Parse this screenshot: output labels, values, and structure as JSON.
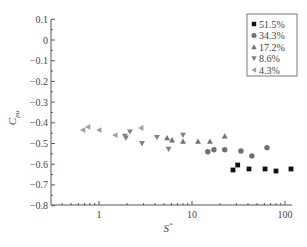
{
  "chart_data": {
    "type": "scatter",
    "title": "",
    "xlabel": "S*",
    "ylabel": "C_pu",
    "xscale": "log",
    "xlim": [
      0.3,
      130
    ],
    "ylim": [
      -0.8,
      0.1
    ],
    "xticks": [
      1,
      10,
      100
    ],
    "xtick_labels": [
      "1",
      "10",
      "100"
    ],
    "yticks": [
      0.1,
      0,
      -0.1,
      -0.2,
      -0.3,
      -0.4,
      -0.5,
      -0.6,
      -0.7,
      -0.8
    ],
    "ytick_labels": [
      "0.1",
      "0",
      "−0.1",
      "−0.2",
      "−0.3",
      "−0.4",
      "−0.5",
      "−0.6",
      "−0.7",
      "−0.8"
    ],
    "grid": false,
    "legend_position": "upper right",
    "series": [
      {
        "name": "51.5%",
        "marker": "square",
        "x": [
          27.6,
          31,
          41,
          61,
          80,
          116
        ],
        "y": [
          -0.628,
          -0.604,
          -0.623,
          -0.623,
          -0.633,
          -0.623
        ]
      },
      {
        "name": "34.3%",
        "marker": "circle",
        "x": [
          14.8,
          17.2,
          22.5,
          33.6,
          44,
          64
        ],
        "y": [
          -0.54,
          -0.53,
          -0.53,
          -0.536,
          -0.56,
          -0.52
        ]
      },
      {
        "name": "17.2%",
        "marker": "triangle-up",
        "x": [
          5.4,
          6.1,
          8.0,
          11.6,
          15.6,
          22.5
        ],
        "y": [
          -0.473,
          -0.483,
          -0.49,
          -0.49,
          -0.49,
          -0.464
        ]
      },
      {
        "name": "8.6%",
        "marker": "triangle-down",
        "x": [
          1.9,
          1.95,
          2.15,
          2.9,
          4.2,
          5.6,
          8.0
        ],
        "y": [
          -0.464,
          -0.473,
          -0.444,
          -0.5,
          -0.47,
          -0.527,
          -0.46
        ]
      },
      {
        "name": "4.3%",
        "marker": "triangle-left",
        "x": [
          0.67,
          0.76,
          1.0,
          1.49,
          2.83
        ],
        "y": [
          -0.435,
          -0.42,
          -0.435,
          -0.46,
          -0.425
        ]
      }
    ]
  },
  "legend": {
    "items": [
      {
        "label": "51.5%",
        "marker": "square"
      },
      {
        "label": "34.3%",
        "marker": "circle"
      },
      {
        "label": "17.2%",
        "marker": "triangle-up"
      },
      {
        "label": "8.6%",
        "marker": "triangle-down"
      },
      {
        "label": "4.3%",
        "marker": "triangle-left"
      }
    ]
  },
  "colors": {
    "series_fill": [
      "#111111",
      "#707070",
      "#707070",
      "#808080",
      "#a0a0a0"
    ],
    "axis": "#555555"
  }
}
